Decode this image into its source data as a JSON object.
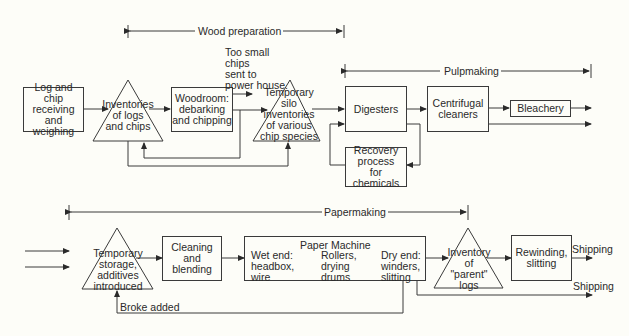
{
  "phases": {
    "wood_preparation": "Wood preparation",
    "pulpmaking": "Pulpmaking",
    "papermaking": "Papermaking"
  },
  "nodes": {
    "log_receiving": "Log and chip\nreceiving\nand weighing",
    "inventories_logs": "Inventories\nof logs\nand chips",
    "woodroom": "Woodroom:\ndebarking\nand chipping",
    "too_small_note": "Too small\nchips\nsent to\npower house.",
    "temporary_silo": "Temporary\nsilo\ninventories\nof various\nchip species",
    "digesters": "Digesters",
    "recovery": "Recovery\nprocess\nfor chemicals",
    "centrifugal": "Centrifugal\ncleaners",
    "bleachery": "Bleachery",
    "temporary_storage": "Temporary\nstorage,\nadditives\nintroduced",
    "cleaning": "Cleaning\nand\nblending",
    "paper_machine_title": "Paper Machine",
    "wet_end": "Wet end:\nheadbox,\nwire",
    "rollers": "Rollers,\ndrying\ndrums",
    "dry_end": "Dry end:\nwinders,\nslitting",
    "inventory_parent": "Inventory\nof\n\"parent\"\nlogs",
    "rewinding": "Rewinding,\nslitting",
    "shipping_1": "Shipping",
    "shipping_2": "Shipping",
    "broke_added": "Broke added"
  }
}
